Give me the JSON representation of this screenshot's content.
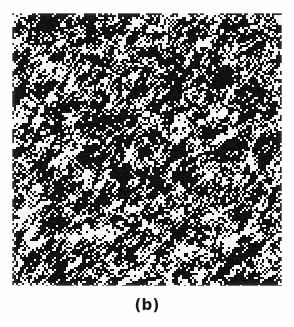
{
  "figure": {
    "panel_label": "(b)",
    "background_color": "#fefefe",
    "plate": {
      "name": "binary-texture-sample",
      "left": 12,
      "top": 13,
      "width": 270,
      "height": 273,
      "foreground_color": "#111111",
      "background_color": "#f6f6f6"
    },
    "texture": {
      "type": "binary-anisotropic-noise",
      "description": "Thresholded black-and-white noise texture with diagonal streaks",
      "orientation_degrees": 45,
      "orientation_direction": "lower-left to upper-right",
      "cell_size_px": 2,
      "black_fraction": 0.62,
      "streak_length_px": 9,
      "streak_width_px": 3,
      "blur_radius_px": 1.1,
      "threshold": 0.5,
      "seed": 20731
    }
  }
}
